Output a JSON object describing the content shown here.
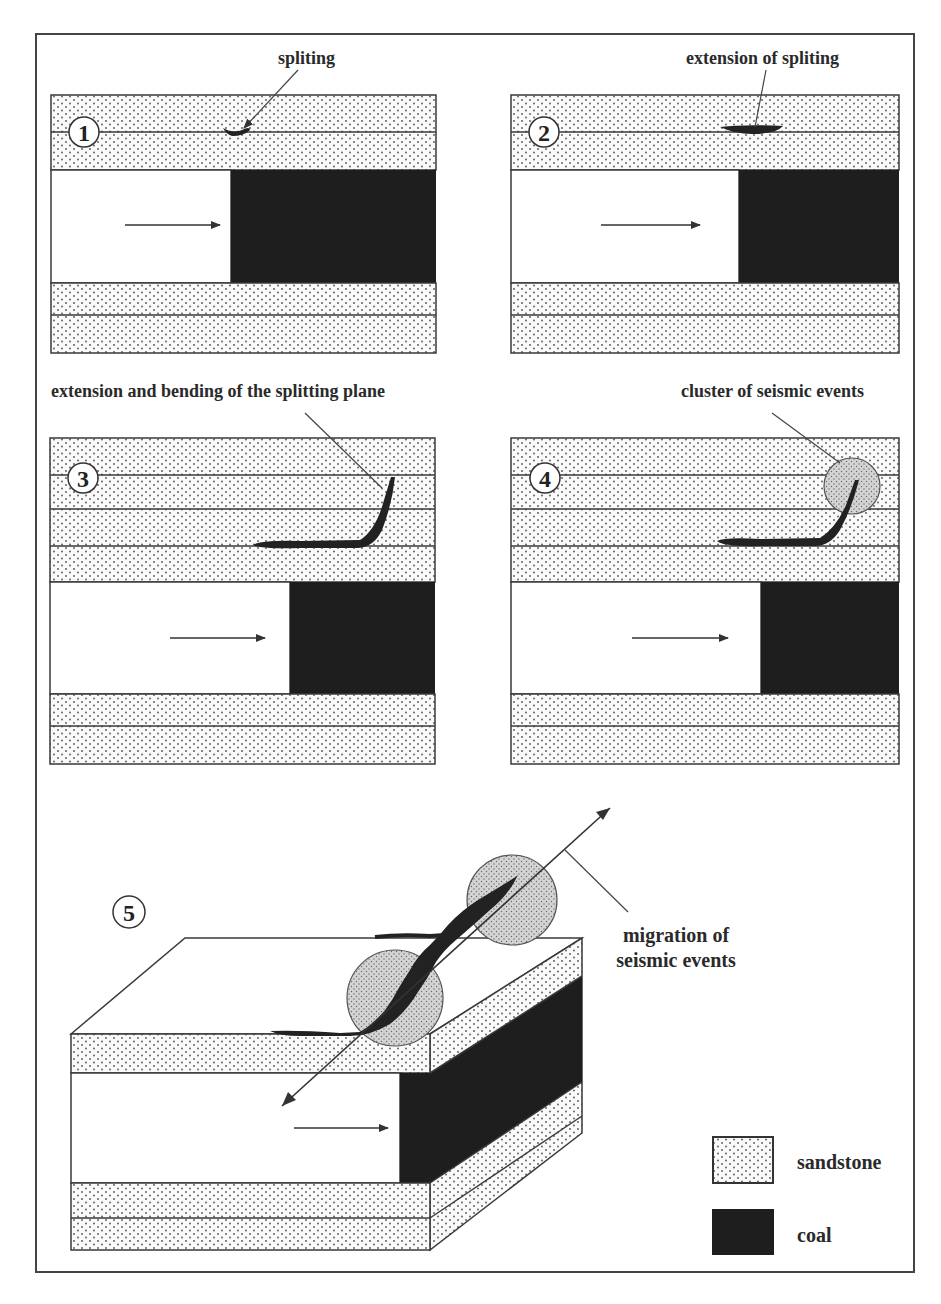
{
  "figure": {
    "panels": [
      {
        "number": "1",
        "label": "spliting"
      },
      {
        "number": "2",
        "label": "extension of spliting"
      },
      {
        "number": "3",
        "label": "extension and bending of the splitting plane"
      },
      {
        "number": "4",
        "label": "cluster of seismic events"
      },
      {
        "number": "5",
        "label_line1": "migration of",
        "label_line2": "seismic events"
      }
    ],
    "legend": [
      {
        "name": "sandstone",
        "pattern": "dotted"
      },
      {
        "name": "coal",
        "color": "#1e1e1e"
      }
    ],
    "colors": {
      "line": "#3a3a3a",
      "coal": "#1e1e1e",
      "dots": "#555555",
      "cluster": "#c8c8c8"
    }
  }
}
